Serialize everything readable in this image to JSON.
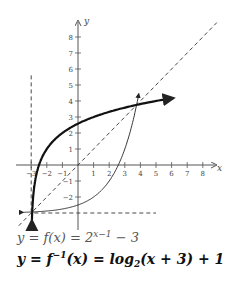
{
  "chart_data": {
    "type": "line",
    "title": "",
    "xlabel": "x",
    "ylabel": "y",
    "xlim": [
      -3.5,
      8.8
    ],
    "ylim": [
      -3.8,
      8.8
    ],
    "grid": false,
    "x_ticks": [
      "-3",
      "-2",
      "-1",
      "1",
      "2",
      "3",
      "4",
      "5",
      "6",
      "7",
      "8"
    ],
    "y_ticks": [
      "-2",
      "-1",
      "1",
      "2",
      "3",
      "4",
      "5",
      "6",
      "7",
      "8"
    ],
    "series": [
      {
        "name": "y = f(x) = 2^(x-1) - 3",
        "style": "thin solid",
        "x": [
          -3.5,
          -2,
          -1,
          0,
          1,
          2,
          2.58,
          3,
          3.5,
          3.9
        ],
        "y": [
          -2.97,
          -2.88,
          -2.75,
          -2.5,
          -2,
          -1,
          0,
          1,
          2.66,
          4.5
        ]
      },
      {
        "name": "y = f^-1(x) = log2(x+3) + 1",
        "style": "thick solid",
        "x": [
          -2.97,
          -2.88,
          -2.75,
          -2.5,
          -2,
          -1,
          0,
          1,
          2,
          3,
          4,
          5.5
        ],
        "y": [
          -3.5,
          -2,
          -1,
          0,
          1,
          2,
          2.58,
          3,
          3.32,
          3.58,
          3.81,
          4.2
        ]
      },
      {
        "name": "y = x",
        "style": "dashed",
        "x": [
          -3.8,
          8.8
        ],
        "y": [
          -3.8,
          8.8
        ]
      },
      {
        "name": "x = -3 (asymptote)",
        "style": "dashed",
        "x": [
          -3,
          -3
        ],
        "y": [
          -3,
          5.5
        ]
      },
      {
        "name": "y = -3 (asymptote)",
        "style": "dashed",
        "x": [
          -3,
          5
        ],
        "y": [
          -3,
          -3
        ]
      }
    ],
    "annotations": [
      "y = f(x) = 2^{x-1} - 3",
      "y = f^{-1}(x) = log_2(x + 3) + 1"
    ]
  },
  "axes": {
    "x_label": "x",
    "y_label": "y"
  },
  "ticks": {
    "x": [
      {
        "v": -3,
        "t": "−3"
      },
      {
        "v": -2,
        "t": "−2"
      },
      {
        "v": -1,
        "t": "−1"
      },
      {
        "v": 1,
        "t": "1"
      },
      {
        "v": 2,
        "t": "2"
      },
      {
        "v": 3,
        "t": "3"
      },
      {
        "v": 4,
        "t": "4"
      },
      {
        "v": 5,
        "t": "5"
      },
      {
        "v": 6,
        "t": "6"
      },
      {
        "v": 7,
        "t": "7"
      },
      {
        "v": 8,
        "t": "8"
      }
    ],
    "y": [
      {
        "v": -2,
        "t": "−2"
      },
      {
        "v": -1,
        "t": "−1"
      },
      {
        "v": 1,
        "t": "1"
      },
      {
        "v": 2,
        "t": "2"
      },
      {
        "v": 3,
        "t": "3"
      },
      {
        "v": 4,
        "t": "4"
      },
      {
        "v": 5,
        "t": "5"
      },
      {
        "v": 6,
        "t": "6"
      },
      {
        "v": 7,
        "t": "7"
      },
      {
        "v": 8,
        "t": "8"
      }
    ]
  },
  "equations": {
    "f": {
      "lhs": "y = f(x) = 2",
      "sup": "x−1",
      "rhs": " − 3"
    },
    "finv": {
      "lhs": "y = f",
      "sup": "−1",
      "mid": "(x) = log",
      "sub": "2",
      "rhs": "(x + 3) + 1"
    }
  }
}
